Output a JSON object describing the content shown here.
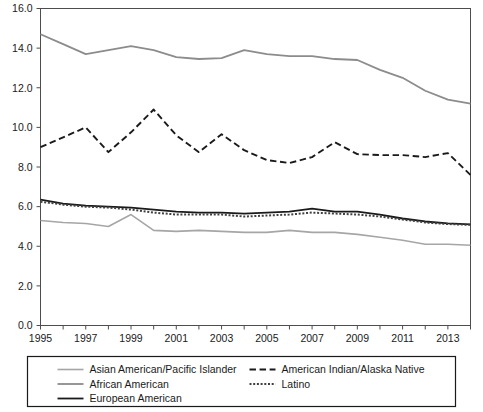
{
  "chart_data": {
    "type": "line",
    "title": "",
    "xlabel": "",
    "ylabel": "",
    "xlim": [
      1995,
      2014
    ],
    "ylim": [
      0.0,
      16.0
    ],
    "grid": false,
    "legend_position": "bottom",
    "x": [
      1995,
      1996,
      1997,
      1998,
      1999,
      2000,
      2001,
      2002,
      2003,
      2004,
      2005,
      2006,
      2007,
      2008,
      2009,
      2010,
      2011,
      2012,
      2013,
      2014
    ],
    "xtick_values": [
      1995,
      1996,
      1997,
      1998,
      1999,
      2000,
      2001,
      2002,
      2003,
      2004,
      2005,
      2006,
      2007,
      2008,
      2009,
      2010,
      2011,
      2012,
      2013,
      2014
    ],
    "xtick_labels": [
      "1995",
      "",
      "1997",
      "",
      "1999",
      "",
      "2001",
      "",
      "2003",
      "",
      "2005",
      "",
      "2007",
      "",
      "2009",
      "",
      "2011",
      "",
      "2013",
      ""
    ],
    "ytick_values": [
      0.0,
      2.0,
      4.0,
      6.0,
      8.0,
      10.0,
      12.0,
      14.0,
      16.0
    ],
    "ytick_labels": [
      "0.0",
      "2.0",
      "4.0",
      "6.0",
      "8.0",
      "10.0",
      "12.0",
      "14.0",
      "16.0"
    ],
    "series": [
      {
        "name": "Asian American/Pacific Islander",
        "style": "solid",
        "color": "#a6a6a6",
        "width": 1.6,
        "values": [
          5.3,
          5.2,
          5.15,
          5.0,
          5.6,
          4.8,
          4.75,
          4.8,
          4.75,
          4.7,
          4.7,
          4.8,
          4.7,
          4.7,
          4.6,
          4.45,
          4.3,
          4.1,
          4.1,
          4.05
        ]
      },
      {
        "name": "African American",
        "style": "solid",
        "color": "#8c8c8c",
        "width": 1.8,
        "values": [
          14.7,
          14.2,
          13.7,
          13.9,
          14.1,
          13.9,
          13.55,
          13.45,
          13.5,
          13.9,
          13.7,
          13.6,
          13.6,
          13.45,
          13.4,
          12.9,
          12.5,
          11.85,
          11.4,
          11.2
        ]
      },
      {
        "name": "European American",
        "style": "solid",
        "color": "#1a1a1a",
        "width": 1.8,
        "values": [
          6.35,
          6.15,
          6.05,
          6.0,
          5.95,
          5.85,
          5.75,
          5.7,
          5.7,
          5.65,
          5.7,
          5.75,
          5.9,
          5.75,
          5.75,
          5.6,
          5.4,
          5.25,
          5.15,
          5.1
        ]
      },
      {
        "name": "American Indian/Alaska Native",
        "style": "dashed",
        "color": "#1a1a1a",
        "width": 1.9,
        "values": [
          9.0,
          9.5,
          10.0,
          8.75,
          9.75,
          10.9,
          9.6,
          8.75,
          9.65,
          8.85,
          8.35,
          8.2,
          8.5,
          9.25,
          8.65,
          8.6,
          8.6,
          8.5,
          8.7,
          7.6
        ]
      },
      {
        "name": "Latino",
        "style": "dotted",
        "color": "#404040",
        "width": 2.0,
        "values": [
          6.25,
          6.1,
          6.0,
          5.95,
          5.85,
          5.7,
          5.6,
          5.6,
          5.6,
          5.5,
          5.55,
          5.6,
          5.7,
          5.65,
          5.6,
          5.5,
          5.35,
          5.2,
          5.12,
          5.08
        ]
      }
    ]
  },
  "legend": {
    "items": [
      {
        "label": "Asian American/Pacific Islander",
        "series_index": 0
      },
      {
        "label": "African American",
        "series_index": 1
      },
      {
        "label": "European American",
        "series_index": 2
      },
      {
        "label": "American Indian/Alaska Native",
        "series_index": 3
      },
      {
        "label": "Latino",
        "series_index": 4
      }
    ]
  }
}
